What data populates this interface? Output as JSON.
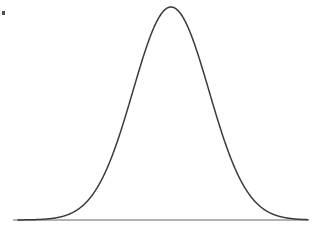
{
  "figure": {
    "kind": "bell-curve",
    "width": 319,
    "height": 229,
    "background_color": "#ffffff",
    "title": "",
    "caption": "",
    "axis_labels": [],
    "tick_labels": [],
    "legend": [],
    "annotations": []
  },
  "style": {
    "curve_color": "#3a3a3a",
    "curve_width": 1.5,
    "baseline_color": "#9a9a9a",
    "baseline_width": 1.4,
    "speck_color": "#2b2b2b"
  },
  "marks": {
    "corner_speck": {
      "label": "scan-artifact-speck",
      "x": 2,
      "y": 11,
      "width": 3,
      "height": 4
    }
  },
  "chart_data": {
    "type": "line",
    "title": "",
    "subtitle": "",
    "xlabel": "",
    "ylabel": "",
    "grid": false,
    "legend_position": "none",
    "curve_name": "normal-distribution",
    "distribution": "gaussian",
    "peak_x": 171,
    "peak_y": 7,
    "baseline_y": 220,
    "baseline_x_start": 13,
    "baseline_x_end": 308,
    "mean_px": 171,
    "sigma_px": 38,
    "fwhm_px": 90,
    "half_max_left_x": 126,
    "half_max_right_x": 216,
    "amplitude_px": 213,
    "xlim": [
      13,
      308
    ],
    "ylim": [
      0,
      229
    ],
    "curve_x_start": 18,
    "curve_x_end": 308,
    "x": [
      18,
      28,
      38,
      48,
      58,
      68,
      78,
      88,
      98,
      108,
      118,
      128,
      138,
      148,
      158,
      168,
      171,
      178,
      188,
      198,
      208,
      218,
      228,
      238,
      248,
      258,
      268,
      278,
      288,
      298,
      308
    ],
    "y": [
      219.9,
      219.7,
      219.2,
      218.0,
      215.4,
      210.3,
      201.4,
      187.2,
      167.0,
      140.9,
      111.0,
      80.2,
      52.4,
      30.9,
      16.6,
      8.2,
      7.0,
      9.3,
      18.4,
      34.3,
      56.3,
      84.2,
      114.7,
      144.5,
      170.4,
      190.0,
      203.6,
      212.0,
      216.6,
      218.8,
      219.7
    ],
    "y_axis_direction": "inverted-pixel-space",
    "series": [
      {
        "name": "normal-distribution-curve",
        "color": "#3a3a3a",
        "values": [
          0.0,
          0.001,
          0.004,
          0.009,
          0.021,
          0.045,
          0.087,
          0.154,
          0.249,
          0.371,
          0.511,
          0.655,
          0.786,
          0.886,
          0.953,
          0.992,
          1.0,
          0.989,
          0.946,
          0.872,
          0.769,
          0.638,
          0.495,
          0.355,
          0.233,
          0.141,
          0.077,
          0.038,
          0.016,
          0.006,
          0.001
        ]
      }
    ]
  }
}
